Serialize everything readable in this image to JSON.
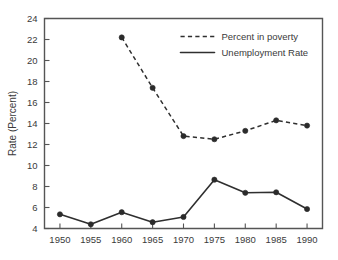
{
  "chart_data": {
    "type": "line",
    "title": "",
    "xlabel": "",
    "ylabel": "Rate (Percent)",
    "xlim": [
      1947.5,
      1992.5
    ],
    "ylim": [
      4,
      24
    ],
    "grid": false,
    "legend_position": "top-right",
    "x": [
      1950,
      1955,
      1960,
      1965,
      1970,
      1975,
      1980,
      1985,
      1990
    ],
    "xticks": [
      "1950",
      "1955",
      "1960",
      "1965",
      "1970",
      "1975",
      "1980",
      "1985",
      "1990"
    ],
    "yticks": [
      "4",
      "6",
      "8",
      "10",
      "12",
      "14",
      "16",
      "18",
      "20",
      "22",
      "24"
    ],
    "series": [
      {
        "name": "Percent in poverty",
        "style": "dashed",
        "color": "#2f2f2f",
        "x": [
          1960,
          1965,
          1970,
          1975,
          1980,
          1985,
          1990
        ],
        "values": [
          22.2,
          17.4,
          12.8,
          12.5,
          13.3,
          14.3,
          13.8
        ]
      },
      {
        "name": "Unemployment Rate",
        "style": "solid",
        "color": "#2f2f2f",
        "x": [
          1950,
          1955,
          1960,
          1965,
          1970,
          1975,
          1980,
          1985,
          1990
        ],
        "values": [
          5.35,
          4.4,
          5.55,
          4.6,
          5.1,
          8.65,
          7.4,
          7.45,
          5.85
        ]
      }
    ]
  },
  "axis": {
    "y_title": "Rate (Percent)"
  },
  "legend": {
    "entries": [
      {
        "label": "Percent in poverty",
        "style": "dashed"
      },
      {
        "label": "Unemployment Rate",
        "style": "solid"
      }
    ]
  }
}
